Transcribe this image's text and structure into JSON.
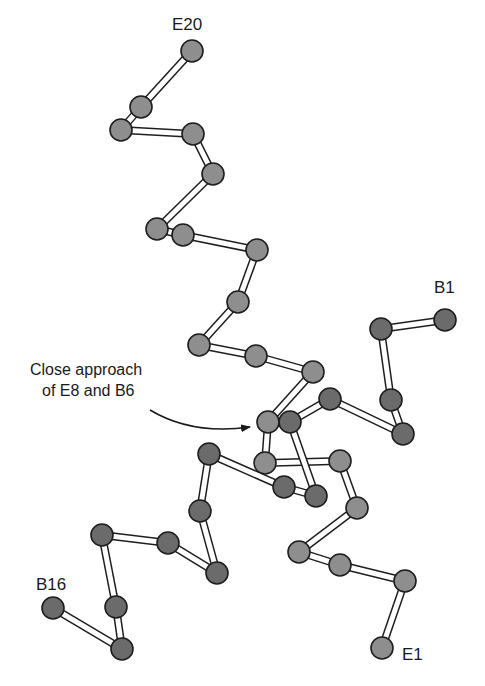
{
  "figure": {
    "title": "",
    "colors": {
      "chain_E_atom": "#8e8e8e",
      "chain_B_atom": "#6b6b6b",
      "atom_outline": "#1e1e1e",
      "bond_fill": "#ffffff",
      "bond_outline": "#1e1e1e",
      "text": "#1a1a1a"
    },
    "atom_radius": 11,
    "bond_width": 8
  },
  "labels": {
    "e20": "E20",
    "e1": "E1",
    "b1": "B1",
    "b16": "B16",
    "annotation_line1": "Close approach",
    "annotation_line2": "of E8 and B6"
  },
  "chains": [
    {
      "name": "E",
      "start_label": "E1",
      "end_label": "E20",
      "atoms": [
        {
          "id": "E1",
          "x": 382,
          "y": 648
        },
        {
          "id": "E2",
          "x": 405,
          "y": 581
        },
        {
          "id": "E3",
          "x": 340,
          "y": 565
        },
        {
          "id": "E4",
          "x": 299,
          "y": 552
        },
        {
          "id": "E5",
          "x": 357,
          "y": 508
        },
        {
          "id": "E6",
          "x": 340,
          "y": 461
        },
        {
          "id": "E7",
          "x": 265,
          "y": 463
        },
        {
          "id": "E8",
          "x": 268,
          "y": 422
        },
        {
          "id": "E9",
          "x": 313,
          "y": 372
        },
        {
          "id": "E10",
          "x": 256,
          "y": 356
        },
        {
          "id": "E11",
          "x": 199,
          "y": 345
        },
        {
          "id": "E12",
          "x": 238,
          "y": 302
        },
        {
          "id": "E13",
          "x": 257,
          "y": 250
        },
        {
          "id": "E14",
          "x": 183,
          "y": 235
        },
        {
          "id": "E15",
          "x": 157,
          "y": 229
        },
        {
          "id": "E16",
          "x": 213,
          "y": 174
        },
        {
          "id": "E17",
          "x": 193,
          "y": 134
        },
        {
          "id": "E18",
          "x": 121,
          "y": 130
        },
        {
          "id": "E19",
          "x": 141,
          "y": 107
        },
        {
          "id": "E20",
          "x": 192,
          "y": 51
        }
      ]
    },
    {
      "name": "B",
      "start_label": "B1",
      "end_label": "B16",
      "atoms": [
        {
          "id": "B1",
          "x": 445,
          "y": 320
        },
        {
          "id": "B2",
          "x": 381,
          "y": 329
        },
        {
          "id": "B3",
          "x": 391,
          "y": 400
        },
        {
          "id": "B4",
          "x": 403,
          "y": 434
        },
        {
          "id": "B5",
          "x": 330,
          "y": 399
        },
        {
          "id": "B6",
          "x": 290,
          "y": 422
        },
        {
          "id": "B7",
          "x": 316,
          "y": 496
        },
        {
          "id": "B8",
          "x": 284,
          "y": 487
        },
        {
          "id": "B9",
          "x": 209,
          "y": 454
        },
        {
          "id": "B10",
          "x": 200,
          "y": 511
        },
        {
          "id": "B11",
          "x": 217,
          "y": 573
        },
        {
          "id": "B12",
          "x": 168,
          "y": 543
        },
        {
          "id": "B13",
          "x": 102,
          "y": 535
        },
        {
          "id": "B14",
          "x": 116,
          "y": 607
        },
        {
          "id": "B15",
          "x": 122,
          "y": 649
        },
        {
          "id": "B16",
          "x": 53,
          "y": 608
        }
      ]
    }
  ],
  "annotation": {
    "text": "Close approach of E8 and B6",
    "points_to": [
      "E8",
      "B6"
    ]
  }
}
